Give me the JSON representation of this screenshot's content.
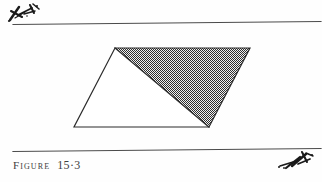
{
  "page": {
    "background_color": "#fefefe",
    "width": 322,
    "height": 182,
    "kind": "scanned-textbook-figure-page"
  },
  "caption": {
    "label_word": "Figure",
    "number": "15·3",
    "full_text": "FIGURE 15·3",
    "color": "#3d3d3d"
  },
  "rules": {
    "top": {
      "name": "top-horizontal-rule",
      "x1": 13,
      "y1": 24.5,
      "x2": 321,
      "y2": 21.5,
      "color": "#4a4a4a",
      "width": 1.1
    },
    "bottom": {
      "name": "bottom-horizontal-rule",
      "x1": 13,
      "y1": 151.5,
      "x2": 321,
      "y2": 148.5,
      "color": "#4a4a4a",
      "width": 1.2
    }
  },
  "figure": {
    "type": "geometry-diagram",
    "parallelogram": {
      "name": "parallelogram-outline",
      "vertices": [
        {
          "label": "top-left",
          "x": 115,
          "y": 48
        },
        {
          "label": "top-right",
          "x": 250,
          "y": 48
        },
        {
          "label": "bottom-right",
          "x": 209,
          "y": 127
        },
        {
          "label": "bottom-left",
          "x": 74,
          "y": 127
        }
      ],
      "stroke_color": "#2b2b2b",
      "stroke_width": 1.2,
      "fill_color": "#ffffff"
    },
    "diagonal": {
      "name": "diagonal-line",
      "from": {
        "x": 115,
        "y": 48
      },
      "to": {
        "x": 209,
        "y": 127
      },
      "stroke_color": "#2b2b2b",
      "stroke_width": 1.3
    },
    "shaded_triangle": {
      "name": "shaded-triangle",
      "vertices": [
        {
          "x": 115,
          "y": 48
        },
        {
          "x": 250,
          "y": 48
        },
        {
          "x": 209,
          "y": 127
        }
      ],
      "fill_pattern": "fine-checkerboard-stipple",
      "pattern_color": "#2e2e2e",
      "pattern_background": "#f2f2f2",
      "pattern_cell_px": 2
    },
    "unshaded_triangle": {
      "name": "unshaded-triangle",
      "vertices": [
        {
          "x": 115,
          "y": 48
        },
        {
          "x": 209,
          "y": 127
        },
        {
          "x": 74,
          "y": 127
        }
      ],
      "fill_color": "#ffffff"
    }
  },
  "artifacts": {
    "top_left_mark": {
      "name": "scan-ink-smudge-top-left",
      "description": "handwritten ink scribble artifact"
    },
    "bottom_right_mark": {
      "name": "scan-ink-smudge-bottom-right",
      "description": "handwritten ink scribble artifact"
    }
  }
}
